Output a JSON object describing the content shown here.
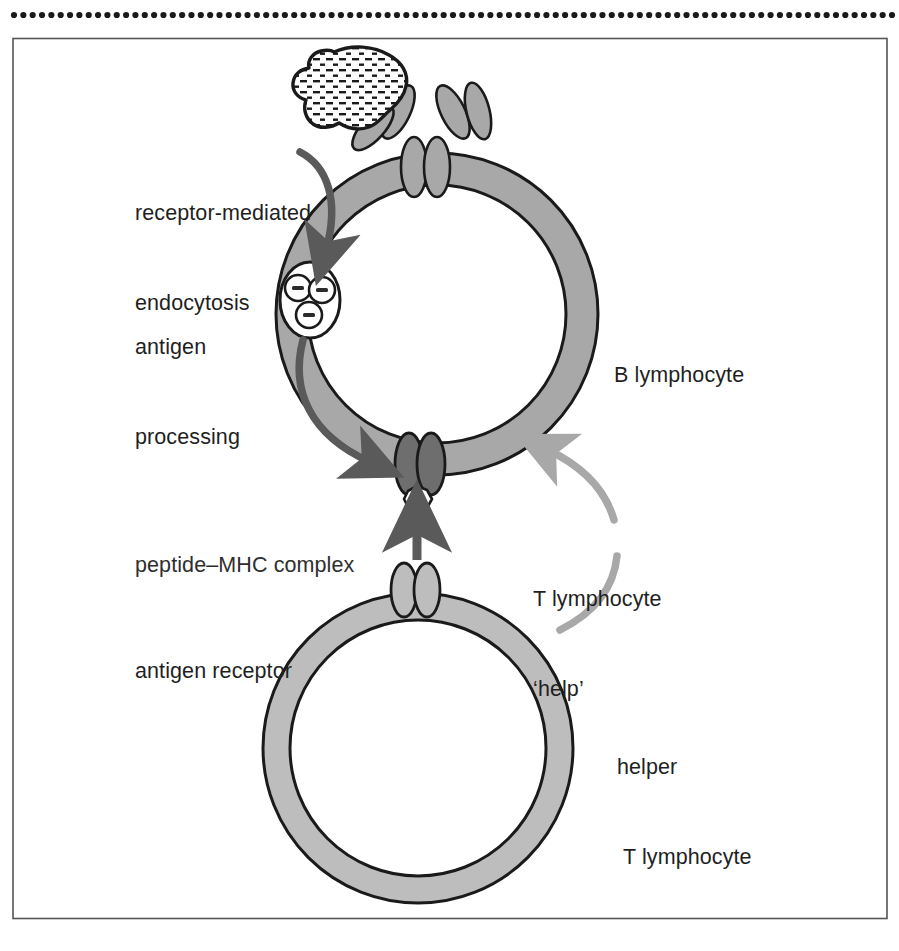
{
  "figure": {
    "border_color": "#555555",
    "background": "#ffffff",
    "dotted_rule": {
      "name": "dotted-rule",
      "dot_count": 95,
      "dot_color": "#1a1a1a",
      "y": 15
    }
  },
  "colors": {
    "membrane_b": "#a8a8a8",
    "membrane_t": "#bdbdbd",
    "membrane_outline": "#1a1a1a",
    "receptor_fill": "#a8a8a8",
    "mhc_fill": "#6e6e6e",
    "antigen_fill": "#fdfdfd",
    "antigen_texture": "#1a1a1a",
    "arrow_dark": "#5a5a5a",
    "arrow_light": "#a8a8a8",
    "peptide_fill": "#ffffff",
    "text": "#1f1f1f"
  },
  "labels": {
    "receptor_mediated_endocytosis": {
      "line1": "receptor-mediated",
      "line2": "endocytosis",
      "x": 135,
      "y": 138
    },
    "antigen_processing": {
      "line1": "antigen",
      "line2": "processing",
      "x": 135,
      "y": 272
    },
    "peptide_mhc_complex": {
      "line1": "peptide–MHC complex",
      "x": 135,
      "y": 490
    },
    "antigen_receptor": {
      "line1": "antigen receptor",
      "x": 135,
      "y": 596
    },
    "b_lymphocyte": {
      "line1": "B lymphocyte",
      "x": 614,
      "y": 300
    },
    "t_lymphocyte_help": {
      "line1": "T lymphocyte",
      "line2": "‘help’",
      "x": 533,
      "y": 524
    },
    "helper_t_lymphocyte": {
      "line1": "helper",
      "line2": "T lymphocyte",
      "x": 617,
      "y": 692
    }
  },
  "structures": {
    "antigen": {
      "name": "antigen-blob",
      "description": "irregular dash-textured antigen particle"
    },
    "b_cell": {
      "name": "b-lymphocyte-cell",
      "cx": 437,
      "cy": 314,
      "outer_r": 161,
      "inner_r": 129
    },
    "t_cell": {
      "name": "helper-t-lymphocyte-cell",
      "cx": 418,
      "cy": 748,
      "outer_r": 155,
      "inner_r": 128
    },
    "surface_immunoglobulin": {
      "name": "surface-immunoglobulin-receptor",
      "count": 2,
      "description": "two Y-shaped antibody receptors on B cell surface"
    },
    "endosome": {
      "name": "antigen-processing-endosome",
      "vesicle_count": 3,
      "description": "endosome containing processed peptide fragments"
    },
    "mhc": {
      "name": "peptide-mhc-complex",
      "description": "dark MHC dimer presenting a white peptide"
    },
    "tcr": {
      "name": "t-cell-antigen-receptor",
      "description": "light grey T cell receptor dimer"
    },
    "arrows": [
      {
        "name": "endocytosis-arrow",
        "style": "dark",
        "from": "surface receptor",
        "to": "endosome"
      },
      {
        "name": "processing-to-presentation-arrow",
        "style": "dark",
        "from": "endosome",
        "to": "peptide-MHC complex"
      },
      {
        "name": "tcr-binding-arrow",
        "style": "dark-straight",
        "from": "T cell receptor",
        "to": "peptide-MHC complex"
      },
      {
        "name": "t-help-arrow",
        "style": "light-curved",
        "from": "helper T lymphocyte",
        "to": "B lymphocyte"
      }
    ]
  }
}
